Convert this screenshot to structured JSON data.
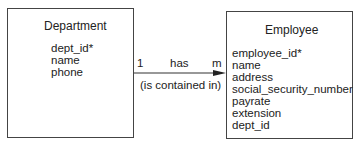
{
  "diagram": {
    "type": "entity-relationship",
    "entities": [
      {
        "id": "department",
        "name": "Department",
        "attributes": [
          "dept_id*",
          "name",
          "phone"
        ]
      },
      {
        "id": "employee",
        "name": "Employee",
        "attributes": [
          "employee_id*",
          "name",
          "address",
          "social_security_number",
          "payrate",
          "extension",
          "dept_id"
        ]
      }
    ],
    "relationship": {
      "from": "Department",
      "to": "Employee",
      "name": "has",
      "inverse_name": "(is contained in)",
      "from_cardinality": "1",
      "to_cardinality": "m"
    },
    "colors": {
      "line": "#444444",
      "text": "#222222",
      "background": "#ffffff"
    }
  }
}
